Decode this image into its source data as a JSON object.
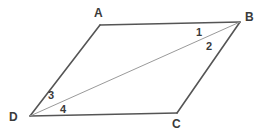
{
  "figure": {
    "kind": "geometry-diagram",
    "shape": "parallelogram-with-diagonal",
    "background_color": "#ffffff",
    "outline_color": "#555555",
    "diagonal_color": "#9a9a9a",
    "label_color": "#3a3a3a",
    "outline_width": 1.6,
    "diagonal_width": 1.0,
    "vertices": [
      {
        "name": "A",
        "label": "A",
        "x": 100,
        "y": 25
      },
      {
        "name": "B",
        "label": "B",
        "x": 240,
        "y": 22
      },
      {
        "name": "C",
        "label": "C",
        "x": 177,
        "y": 113
      },
      {
        "name": "D",
        "label": "D",
        "x": 30,
        "y": 116
      }
    ],
    "edges": [
      {
        "name": "AB",
        "from": "A",
        "to": "B",
        "style": "solid-dark"
      },
      {
        "name": "BC",
        "from": "B",
        "to": "C",
        "style": "solid-dark"
      },
      {
        "name": "CD",
        "from": "C",
        "to": "D",
        "style": "solid-dark"
      },
      {
        "name": "DA",
        "from": "D",
        "to": "A",
        "style": "solid-dark"
      }
    ],
    "diagonal": {
      "name": "DB",
      "from": "D",
      "to": "B",
      "style": "solid-light"
    },
    "angle_labels": [
      {
        "name": "angle-1",
        "label": "1",
        "at_vertex": "B",
        "between": "BA and BD"
      },
      {
        "name": "angle-2",
        "label": "2",
        "at_vertex": "B",
        "between": "BD and BC"
      },
      {
        "name": "angle-3",
        "label": "3",
        "at_vertex": "D",
        "between": "DA and DB"
      },
      {
        "name": "angle-4",
        "label": "4",
        "at_vertex": "D",
        "between": "DB and DC"
      }
    ]
  }
}
